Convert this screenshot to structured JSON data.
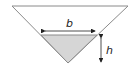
{
  "diagram": {
    "labels": {
      "width": "b",
      "height": "h"
    },
    "colors": {
      "outline": "#8a8a8a",
      "fill_shaded": "#d6d6d6",
      "arrow": "#222222",
      "background": "#ffffff"
    }
  }
}
